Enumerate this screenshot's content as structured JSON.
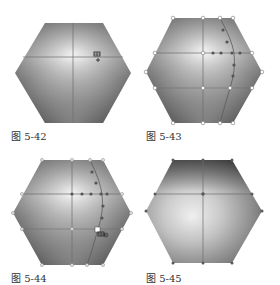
{
  "figures": [
    {
      "id": "fig-5-42",
      "caption": "图 5-42",
      "description": "Hexagon with gradient mesh, mesh tool cursor adding a point",
      "cursor": "mesh-tool-add-cursor"
    },
    {
      "id": "fig-5-43",
      "caption": "图 5-43",
      "description": "Hexagon with gradient mesh, new mesh line and selected anchor points shown"
    },
    {
      "id": "fig-5-44",
      "caption": "图 5-44",
      "description": "Hexagon with gradient mesh, mesh tool cursor on a mesh point",
      "cursor": "mesh-tool-delete-cursor"
    },
    {
      "id": "fig-5-45",
      "caption": "图 5-45",
      "description": "Hexagon with gradient mesh after mesh line removed"
    }
  ],
  "colors": {
    "background": "#ffffff",
    "hex_dark": "#4a4a4a",
    "hex_mid": "#8a8a8a",
    "hex_light": "#f4f4f4",
    "mesh_line": "#6e6e6e",
    "anchor_selected": "#555555",
    "anchor_unselected": "#ffffff",
    "caption_text": "#333333"
  }
}
